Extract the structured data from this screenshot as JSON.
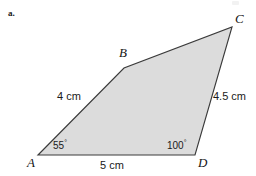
{
  "figure": {
    "item_marker": "a.",
    "shape_type": "quadrilateral",
    "fill_color": "#dcdcdc",
    "stroke_color": "#3a3a3a",
    "vertices": [
      {
        "name": "A",
        "label": "A",
        "x": 38,
        "y": 155
      },
      {
        "name": "B",
        "label": "B",
        "x": 124,
        "y": 68
      },
      {
        "name": "C",
        "label": "C",
        "x": 232,
        "y": 27
      },
      {
        "name": "D",
        "label": "D",
        "x": 195,
        "y": 155
      }
    ],
    "polygon_points": "38,155 124,68 232,27 195,155",
    "sides": [
      {
        "name": "AB",
        "label": "4 cm",
        "value": 4,
        "unit": "cm"
      },
      {
        "name": "CD",
        "label": "4.5 cm",
        "value": 4.5,
        "unit": "cm"
      },
      {
        "name": "AD",
        "label": "5 cm",
        "value": 5,
        "unit": "cm"
      }
    ],
    "angles": [
      {
        "at": "A",
        "value": "55",
        "degree_symbol": "°"
      },
      {
        "at": "D",
        "value": "100",
        "degree_symbol": "°"
      }
    ]
  }
}
